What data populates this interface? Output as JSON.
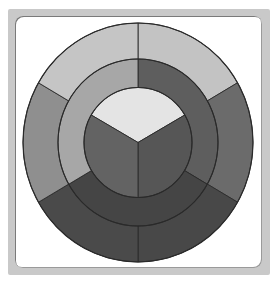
{
  "diagram": {
    "title": "",
    "center": {
      "x": 138,
      "y": 142.5
    },
    "rings": {
      "outer": {
        "rx": 115,
        "ry": 119.5,
        "segments": [
          {
            "name": "outer-top-right",
            "start": 0,
            "end": 60,
            "color": "#c3c3c3"
          },
          {
            "name": "outer-right",
            "start": 60,
            "end": 120,
            "color": "#6b6b6b"
          },
          {
            "name": "outer-bottom-right",
            "start": 120,
            "end": 180,
            "color": "#484848"
          },
          {
            "name": "outer-bottom-left",
            "start": 180,
            "end": 240,
            "color": "#4a4a4a"
          },
          {
            "name": "outer-left",
            "start": 240,
            "end": 300,
            "color": "#8f8f8f"
          },
          {
            "name": "outer-top-left",
            "start": 300,
            "end": 360,
            "color": "#c5c5c5"
          }
        ]
      },
      "middle": {
        "rx": 80,
        "ry": 83.5,
        "segments": [
          {
            "name": "middle-top-right",
            "start": 0,
            "end": 120,
            "color": "#5e5e5e"
          },
          {
            "name": "middle-bottom",
            "start": 120,
            "end": 240,
            "color": "#454545"
          },
          {
            "name": "middle-top-left",
            "start": 240,
            "end": 360,
            "color": "#a7a7a7"
          }
        ]
      },
      "inner": {
        "rx": 54,
        "ry": 55,
        "segments": [
          {
            "name": "inner-top",
            "start": 300,
            "end": 420,
            "color": "#e4e4e4"
          },
          {
            "name": "inner-right",
            "start": 60,
            "end": 180,
            "color": "#565656"
          },
          {
            "name": "inner-left",
            "start": 180,
            "end": 300,
            "color": "#636363"
          }
        ]
      }
    },
    "stroke_color": "#2a2a2a",
    "frame_color": "#c9c9c9",
    "panel_color": "#ffffff"
  }
}
